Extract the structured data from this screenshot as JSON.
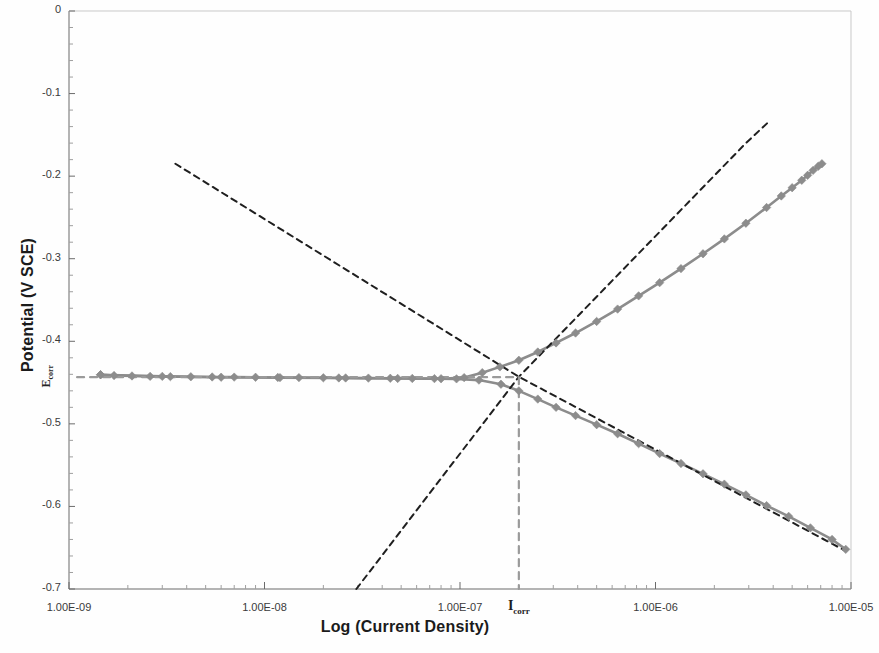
{
  "chart_data": {
    "type": "line",
    "title": "",
    "xlabel": "Log (Current Density)",
    "ylabel": "Potential (V SCE)",
    "xscale": "log",
    "xlim": [
      1e-09,
      1e-05
    ],
    "ylim": [
      -0.7,
      0.0
    ],
    "grid": false,
    "legend": null,
    "xtick_labels": [
      "1.00E-09",
      "1.00E-08",
      "1.00E-07",
      "1.00E-06",
      "1.00E-05"
    ],
    "xtick_values": [
      1e-09,
      1e-08,
      1e-07,
      1e-06,
      1e-05
    ],
    "ytick_labels": [
      "0",
      "-0.1",
      "-0.2",
      "-0.3",
      "-0.4",
      "-0.5",
      "-0.6",
      "-0.7"
    ],
    "ytick_values": [
      0,
      -0.1,
      -0.2,
      -0.3,
      -0.4,
      -0.5,
      -0.6,
      -0.7
    ],
    "yminor_step": 0.02,
    "annotations": [
      {
        "name": "ecorr",
        "text": "E",
        "subscript": "corr",
        "axis": "y",
        "value": -0.443
      },
      {
        "name": "icorr",
        "text": "I",
        "subscript": "corr",
        "axis": "x",
        "value": 2e-07
      }
    ],
    "series": [
      {
        "name": "cathodic-branch",
        "style": "solid-markers",
        "color": "#8c8c8c",
        "marker": "diamond",
        "points": [
          [
            1.45e-09,
            -0.4405
          ],
          [
            1.7e-09,
            -0.4415
          ],
          [
            2.1e-09,
            -0.442
          ],
          [
            2.6e-09,
            -0.4425
          ],
          [
            3.3e-09,
            -0.4428
          ],
          [
            4.2e-09,
            -0.443
          ],
          [
            5.4e-09,
            -0.4432
          ],
          [
            7e-09,
            -0.4434
          ],
          [
            9e-09,
            -0.4436
          ],
          [
            1.17e-08,
            -0.4438
          ],
          [
            1.5e-08,
            -0.444
          ],
          [
            2e-08,
            -0.4442
          ],
          [
            2.6e-08,
            -0.4444
          ],
          [
            3.4e-08,
            -0.4446
          ],
          [
            4.4e-08,
            -0.4448
          ],
          [
            5.7e-08,
            -0.445
          ],
          [
            7.4e-08,
            -0.4452
          ],
          [
            9.6e-08,
            -0.4455
          ],
          [
            1.25e-07,
            -0.447
          ],
          [
            1.62e-07,
            -0.452
          ],
          [
            2e-07,
            -0.46
          ],
          [
            2.5e-07,
            -0.47
          ],
          [
            3.1e-07,
            -0.48
          ],
          [
            3.9e-07,
            -0.49
          ],
          [
            5e-07,
            -0.501
          ],
          [
            6.4e-07,
            -0.512
          ],
          [
            8.2e-07,
            -0.524
          ],
          [
            1.05e-06,
            -0.536
          ],
          [
            1.35e-06,
            -0.548
          ],
          [
            1.75e-06,
            -0.5605
          ],
          [
            2.25e-06,
            -0.573
          ],
          [
            2.9e-06,
            -0.586
          ],
          [
            3.7e-06,
            -0.599
          ],
          [
            4.8e-06,
            -0.612
          ],
          [
            6.2e-06,
            -0.626
          ],
          [
            8e-06,
            -0.64
          ],
          [
            9.4e-06,
            -0.652
          ]
        ]
      },
      {
        "name": "anodic-branch",
        "style": "solid-markers",
        "color": "#8c8c8c",
        "marker": "diamond",
        "points": [
          [
            1.45e-09,
            -0.4405
          ],
          [
            3e-09,
            -0.4425
          ],
          [
            6e-09,
            -0.4435
          ],
          [
            1.2e-08,
            -0.444
          ],
          [
            2.4e-08,
            -0.4444
          ],
          [
            4.8e-08,
            -0.445
          ],
          [
            8e-08,
            -0.4453
          ],
          [
            1.05e-07,
            -0.444
          ],
          [
            1.3e-07,
            -0.438
          ],
          [
            1.6e-07,
            -0.431
          ],
          [
            2e-07,
            -0.423
          ],
          [
            2.5e-07,
            -0.413
          ],
          [
            3.1e-07,
            -0.402
          ],
          [
            3.9e-07,
            -0.39
          ],
          [
            5e-07,
            -0.376
          ],
          [
            6.4e-07,
            -0.361
          ],
          [
            8.2e-07,
            -0.345
          ],
          [
            1.05e-06,
            -0.329
          ],
          [
            1.35e-06,
            -0.312
          ],
          [
            1.75e-06,
            -0.294
          ],
          [
            2.25e-06,
            -0.276
          ],
          [
            2.9e-06,
            -0.257
          ],
          [
            3.7e-06,
            -0.238
          ],
          [
            4.4e-06,
            -0.224
          ],
          [
            5e-06,
            -0.214
          ],
          [
            5.6e-06,
            -0.205
          ],
          [
            6e-06,
            -0.199
          ],
          [
            6.4e-06,
            -0.193
          ],
          [
            6.8e-06,
            -0.188
          ],
          [
            7.1e-06,
            -0.185
          ]
        ]
      },
      {
        "name": "anodic-tafel-extrapolation",
        "style": "dashed",
        "color": "#1f1f1f",
        "points": [
          [
            2.95e-08,
            -0.7
          ],
          [
            2e-07,
            -0.443
          ],
          [
            2.9e-06,
            -0.16
          ],
          [
            3.8e-06,
            -0.134
          ]
        ]
      },
      {
        "name": "cathodic-tafel-extrapolation",
        "style": "dashed",
        "color": "#1f1f1f",
        "points": [
          [
            3.5e-09,
            -0.185
          ],
          [
            2e-07,
            -0.443
          ],
          [
            9.4e-06,
            -0.654
          ]
        ]
      },
      {
        "name": "ecorr-guide-line",
        "style": "dashed",
        "color": "#9a9a9a",
        "points": [
          [
            1.1e-09,
            -0.4435
          ],
          [
            2e-07,
            -0.4435
          ]
        ]
      },
      {
        "name": "icorr-guide-line",
        "style": "dashed",
        "color": "#9a9a9a",
        "points": [
          [
            2e-07,
            -0.4435
          ],
          [
            2e-07,
            -0.7
          ]
        ]
      }
    ]
  },
  "axes": {
    "ylabel_title": "Potential (V SCE)",
    "xlabel_title": "Log (Current Density)",
    "ytick_labels": [
      "0",
      "-0.1",
      "-0.2",
      "-0.3",
      "-0.4",
      "-0.5",
      "-0.6",
      "-0.7"
    ],
    "xtick_labels": [
      "1.00E-09",
      "1.00E-08",
      "1.00E-07",
      "1.00E-06",
      "1.00E-05"
    ],
    "ecorr_text": "E",
    "ecorr_sub": "corr",
    "icorr_text": "I",
    "icorr_sub": "corr"
  },
  "colors": {
    "curve": "#8c8c8c",
    "tafel_line": "#1f1f1f",
    "guide_line": "#9a9a9a",
    "axis": "#6b6b6b",
    "text": "#2b2b2b",
    "background": "#fefefe"
  }
}
